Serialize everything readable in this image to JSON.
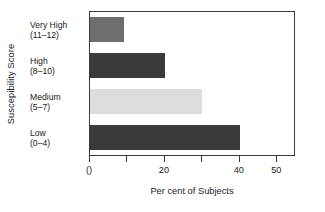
{
  "chart_data": {
    "type": "bar",
    "orientation": "horizontal",
    "title": "",
    "xlabel": "Per cent of Subjects",
    "ylabel": "Suscepibility Score",
    "categories": [
      "Very High\n(11–12)",
      "High\n(8–10)",
      "Medium\n(5–7)",
      "Low\n(0–4)"
    ],
    "category_lines": [
      {
        "name": "Very High",
        "range": "(11–12)"
      },
      {
        "name": "High",
        "range": "(8–10)"
      },
      {
        "name": "Medium",
        "range": "(5–7)"
      },
      {
        "name": "Low",
        "range": "(0–4)"
      }
    ],
    "values": [
      9,
      20,
      30,
      40
    ],
    "bar_colors": [
      "#6e6e6e",
      "#3a3a3a",
      "#dcdcdc",
      "#3a3a3a"
    ],
    "xlim": [
      0,
      55
    ],
    "xticks": [
      0,
      10,
      20,
      30,
      40,
      50
    ],
    "xtick_labels": [
      "0",
      "",
      "20",
      "",
      "40",
      "50"
    ],
    "xtick_label_display": {
      "0": "()",
      "20": "20",
      "40": "40",
      "50": "50"
    },
    "grid": false,
    "legend": null,
    "axis_color": "#3b3b3b",
    "background": "#ffffff"
  },
  "axes": {
    "y_title": "Suscepibility Score",
    "x_title": "Per cent of Subjects"
  },
  "ticks": [
    {
      "value": 0,
      "label": "()"
    },
    {
      "value": 10,
      "label": ""
    },
    {
      "value": 20,
      "label": "20"
    },
    {
      "value": 30,
      "label": ""
    },
    {
      "value": 40,
      "label": "40"
    },
    {
      "value": 50,
      "label": "50"
    }
  ]
}
